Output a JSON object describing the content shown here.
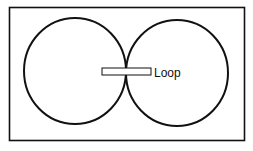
{
  "diagram": {
    "title": "",
    "type": "figure-eight radiation pattern with loop antenna",
    "elements": {
      "frame": {
        "x": 9,
        "y": 7,
        "width": 235,
        "height": 134
      },
      "left_lobe": {
        "cx": 75,
        "cy": 71,
        "rx": 51,
        "ry": 53
      },
      "right_lobe": {
        "cx": 177,
        "cy": 73,
        "rx": 51,
        "ry": 53
      },
      "loop_rect": {
        "x": 102,
        "y": 68,
        "width": 49,
        "height": 7
      }
    },
    "labels": {
      "loop": "Loop"
    },
    "colors": {
      "stroke": "#111111",
      "background": "#ffffff"
    }
  }
}
